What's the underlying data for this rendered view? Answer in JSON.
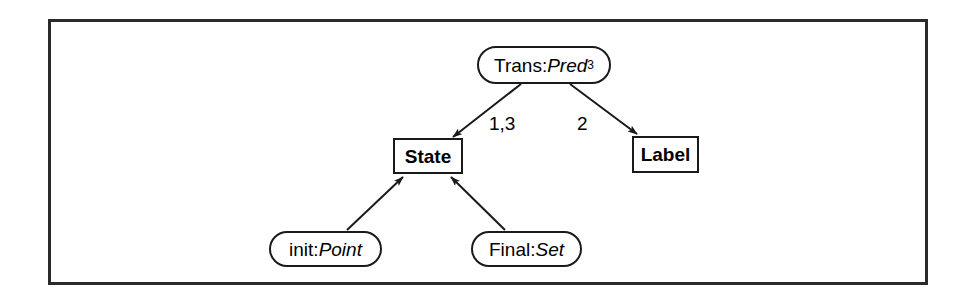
{
  "diagram": {
    "kind": "class-diagram",
    "frame": {
      "border_color": "#2b2b2b",
      "background": "#ffffff"
    },
    "stroke_color": "#1a1a1a",
    "nodes": [
      {
        "id": "trans",
        "shape": "rounded",
        "role": "name",
        "prefix": "Trans:",
        "type_name": "Pred",
        "superscript": "3",
        "text": "Trans:Pred3",
        "bold": false,
        "x": 478,
        "y": 47,
        "w": 132,
        "h": 36
      },
      {
        "id": "state",
        "shape": "rectangle",
        "role": "name",
        "prefix": "State",
        "type_name": "",
        "superscript": "",
        "text": "State",
        "bold": true,
        "x": 394,
        "y": 139,
        "w": 68,
        "h": 34
      },
      {
        "id": "label",
        "shape": "rectangle",
        "role": "name",
        "prefix": "Label",
        "type_name": "",
        "superscript": "",
        "text": "Label",
        "bold": true,
        "x": 633,
        "y": 137,
        "w": 65,
        "h": 35
      },
      {
        "id": "init",
        "shape": "rounded",
        "role": "name",
        "prefix": "init:",
        "type_name": "Point",
        "superscript": "",
        "text": "init:Point",
        "bold": false,
        "x": 270,
        "y": 232,
        "w": 111,
        "h": 34
      },
      {
        "id": "final",
        "shape": "rounded",
        "role": "name",
        "prefix": "Final:",
        "type_name": "Set",
        "superscript": "",
        "text": "Final:Set",
        "bold": false,
        "x": 472,
        "y": 232,
        "w": 109,
        "h": 34
      }
    ],
    "edges": [
      {
        "id": "trans-state",
        "from": "trans",
        "to": "state",
        "label": "1,3",
        "label_x": 489,
        "label_y": 114,
        "arrowhead": "filled",
        "x1": 521,
        "y1": 84,
        "x2": 453,
        "y2": 137
      },
      {
        "id": "trans-label",
        "from": "trans",
        "to": "label",
        "label": "2",
        "label_x": 577,
        "label_y": 114,
        "arrowhead": "filled",
        "x1": 570,
        "y1": 84,
        "x2": 637,
        "y2": 134
      },
      {
        "id": "init-state",
        "from": "init",
        "to": "state",
        "label": "",
        "label_x": 0,
        "label_y": 0,
        "arrowhead": "filled",
        "x1": 347,
        "y1": 230,
        "x2": 404,
        "y2": 176
      },
      {
        "id": "final-state",
        "from": "final",
        "to": "state",
        "label": "",
        "label_x": 0,
        "label_y": 0,
        "arrowhead": "filled",
        "x1": 505,
        "y1": 230,
        "x2": 450,
        "y2": 176
      }
    ]
  }
}
